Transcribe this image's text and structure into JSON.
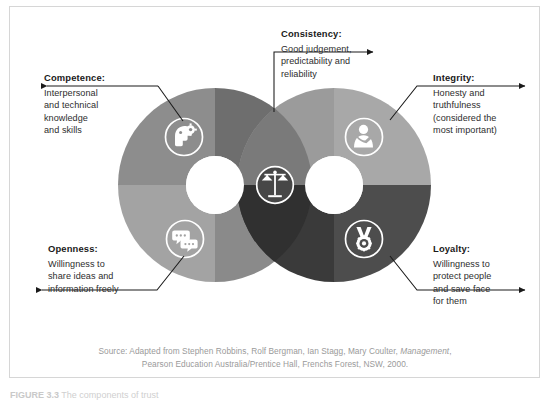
{
  "figure": {
    "caption_number": "FIGURE 3.3",
    "caption_text": "The components of trust"
  },
  "colors": {
    "frame_border": "#d6d6d6",
    "background": "#ffffff",
    "text": "#231f20",
    "source_text": "#9a9a9a",
    "left_q_top_left": "#8d8d8d",
    "left_q_top_right": "#6e6e6e",
    "left_q_bottom_left": "#a3a3a3",
    "left_q_bottom_right": "#8a8a8a",
    "right_q_top_left": "#9b9b9b",
    "right_q_top_right": "#a8a8a8",
    "right_q_bottom_left": "#3a3a3a",
    "right_q_bottom_right": "#4d4d4d",
    "overlap_top": "#7a7a7a",
    "overlap_bottom": "#303030",
    "icon_fill": "#ffffff",
    "hole": "#ffffff",
    "arrow": "#1a1a1a"
  },
  "diagram": {
    "type": "venn-donut",
    "center_icon": "scales-icon",
    "left_circle": {
      "center_x": 215,
      "center_y": 185,
      "radius": 97,
      "hole_radius": 29,
      "icons": [
        "head-gear-icon",
        "speech-bubbles-icon"
      ]
    },
    "right_circle": {
      "center_x": 334,
      "center_y": 185,
      "radius": 97,
      "hole_radius": 29,
      "icons": [
        "person-heart-icon",
        "medal-icon"
      ]
    }
  },
  "callouts": [
    {
      "id": "competence",
      "title": "Competence:",
      "lines": [
        "Interpersonal",
        "and technical",
        "knowledge",
        "and skills"
      ],
      "arrow_direction": "left",
      "icon": "head-gear-icon"
    },
    {
      "id": "consistency",
      "title": "Consistency:",
      "lines": [
        "Good judgement,",
        "predictability and",
        "reliability"
      ],
      "arrow_direction": "right",
      "icon": "scales-icon"
    },
    {
      "id": "integrity",
      "title": "Integrity:",
      "lines": [
        "Honesty and",
        "truthfulness",
        "(considered the",
        "most important)"
      ],
      "arrow_direction": "right",
      "icon": "person-heart-icon"
    },
    {
      "id": "openness",
      "title": "Openness:",
      "lines": [
        "Willingness to",
        "share ideas and",
        "information freely"
      ],
      "arrow_direction": "left",
      "icon": "speech-bubbles-icon"
    },
    {
      "id": "loyalty",
      "title": "Loyalty:",
      "lines": [
        "Willingness to",
        "protect people",
        "and save face",
        "for them"
      ],
      "arrow_direction": "right",
      "icon": "medal-icon"
    }
  ],
  "source": {
    "line1_pre": "Source: Adapted from Stephen Robbins, Rolf Bergman, Ian Stagg, Mary Coulter, ",
    "line1_italic": "Management",
    "line1_post": ",",
    "line2": "Pearson Education Australia/Prentice Hall, Frenchs Forest, NSW, 2000."
  }
}
